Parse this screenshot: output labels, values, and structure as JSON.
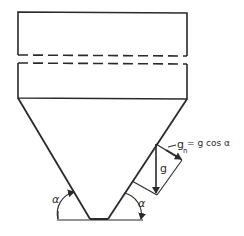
{
  "diagram": {
    "type": "silo-hopper-gravity-decomposition",
    "labels": {
      "angle_left": "α",
      "angle_right": "α",
      "gravity": "g",
      "normal_component_symbol": "g",
      "normal_component_subscript": "n",
      "normal_component_equation": "= g cos α"
    },
    "colors": {
      "stroke": "#2a2a2a",
      "background": "#ffffff"
    }
  }
}
